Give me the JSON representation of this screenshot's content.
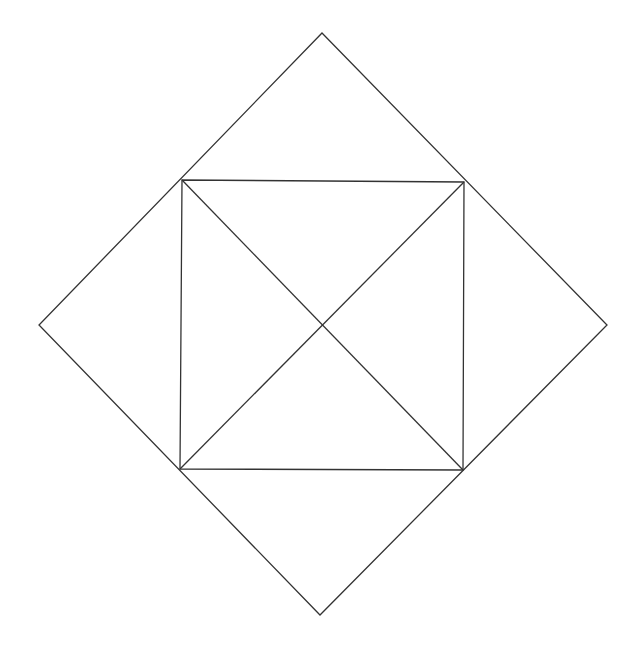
{
  "diagram": {
    "width": 643,
    "height": 659,
    "background": "#ffffff",
    "stroke_color": "#333333",
    "stroke_width": 1.3,
    "outer_diamond": {
      "top": [
        322,
        33
      ],
      "right": [
        607,
        325
      ],
      "bottom": [
        320,
        615
      ],
      "left": [
        39,
        325
      ]
    },
    "inner_square": {
      "top_left": [
        182,
        180
      ],
      "top_right": [
        464,
        182
      ],
      "bottom_right": [
        463,
        470
      ],
      "bottom_left": [
        180,
        469
      ]
    },
    "diagonals": [
      {
        "from": [
          182,
          180
        ],
        "to": [
          463,
          470
        ]
      },
      {
        "from": [
          464,
          182
        ],
        "to": [
          180,
          469
        ]
      }
    ]
  }
}
